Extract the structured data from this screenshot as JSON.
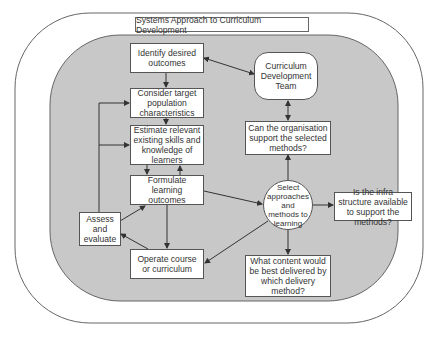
{
  "title": "Systems Approach to Curriculum Development",
  "colors": {
    "inner_region": "#c8c8c8",
    "box_fill": "#ffffff",
    "border": "#555555",
    "arrow": "#333333"
  },
  "nodes": {
    "identify": "Identify desired outcomes",
    "consider": "Consider target population characteristics",
    "estimate": "Estimate relevant existing skills and knowledge of learners",
    "formulate": "Formulate learning outcomes",
    "assess": "Assess and evaluate",
    "operate": "Operate course or curriculum",
    "team": "Curriculum Development Team",
    "organisation": "Can the organisation support the selected methods?",
    "select": "Select approaches and methods to learning",
    "infra": "Is the infra structure available to support the methods?",
    "content": "What content would be best delivered by which delivery method?"
  },
  "edges": [
    {
      "from": "identify",
      "to": "consider"
    },
    {
      "from": "consider",
      "to": "estimate"
    },
    {
      "from": "estimate",
      "to": "formulate"
    },
    {
      "from": "formulate",
      "to": "estimate"
    },
    {
      "from": "formulate",
      "to": "operate"
    },
    {
      "from": "formulate",
      "to": "select"
    },
    {
      "from": "operate",
      "to": "assess"
    },
    {
      "from": "assess",
      "to": "formulate"
    },
    {
      "from": "assess",
      "to": "consider"
    },
    {
      "from": "assess",
      "to": "estimate"
    },
    {
      "from": "select",
      "to": "operate"
    },
    {
      "from": "select",
      "to": "organisation"
    },
    {
      "from": "select",
      "to": "infra"
    },
    {
      "from": "select",
      "to": "content"
    },
    {
      "from": "organisation",
      "to": "team",
      "bidirectional": true
    },
    {
      "from": "team",
      "to": "identify",
      "bidirectional": true
    }
  ]
}
